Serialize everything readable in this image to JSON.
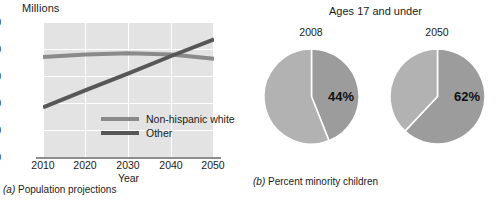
{
  "chart_data": [
    {
      "type": "line",
      "panel": "a",
      "caption_prefix": "(a)",
      "caption": "Population projections",
      "title": "",
      "xlabel": "Year",
      "ylabel": "Millions",
      "x": [
        2010,
        2020,
        2030,
        2040,
        2050
      ],
      "xlim": [
        2010,
        2050
      ],
      "ylim": [
        0,
        250
      ],
      "yticks": [
        250,
        200,
        150,
        100,
        50,
        0
      ],
      "xticks": [
        "2010",
        "2020",
        "2030",
        "2040",
        "2050"
      ],
      "grid": true,
      "legend_position": "inside-center-right",
      "series": [
        {
          "name": "Non-hispanic white",
          "color": "#8a8a8a",
          "values": [
            185,
            190,
            192,
            190,
            182
          ]
        },
        {
          "name": "Other",
          "color": "#575757",
          "values": [
            92,
            124,
            155,
            187,
            218
          ]
        }
      ],
      "annotations": [
        "Lines cross near year 2041 at about 189 million"
      ]
    },
    {
      "type": "pie",
      "panel": "b",
      "caption_prefix": "(b)",
      "caption": "Percent minority children",
      "title": "Ages 17 and under",
      "charts": [
        {
          "label": "2008",
          "value_label": "44%",
          "slices": [
            {
              "name": "minority",
              "value": 44,
              "color": "#9c9c9c"
            },
            {
              "name": "non-minority",
              "value": 56,
              "color": "#b2b2b2"
            }
          ]
        },
        {
          "label": "2050",
          "value_label": "62%",
          "slices": [
            {
              "name": "minority",
              "value": 62,
              "color": "#9c9c9c"
            },
            {
              "name": "non-minority",
              "value": 38,
              "color": "#b2b2b2"
            }
          ]
        }
      ]
    }
  ],
  "panel_a": {
    "ylabel": "Millions",
    "xlabel": "Year",
    "yticks": [
      "250",
      "200",
      "150",
      "100",
      "50",
      "0"
    ],
    "xticks": [
      "2010",
      "2020",
      "2030",
      "2040",
      "2050"
    ],
    "legend": [
      {
        "label": "Non-hispanic white",
        "color": "#8a8a8a"
      },
      {
        "label": "Other",
        "color": "#575757"
      }
    ],
    "caption_prefix": "(a)",
    "caption_text": "Population projections"
  },
  "panel_b": {
    "title": "Ages 17 and under",
    "pies": [
      {
        "year": "2008",
        "percent": "44%"
      },
      {
        "year": "2050",
        "percent": "62%"
      }
    ],
    "caption_prefix": "(b)",
    "caption_text": "Percent minority children"
  }
}
